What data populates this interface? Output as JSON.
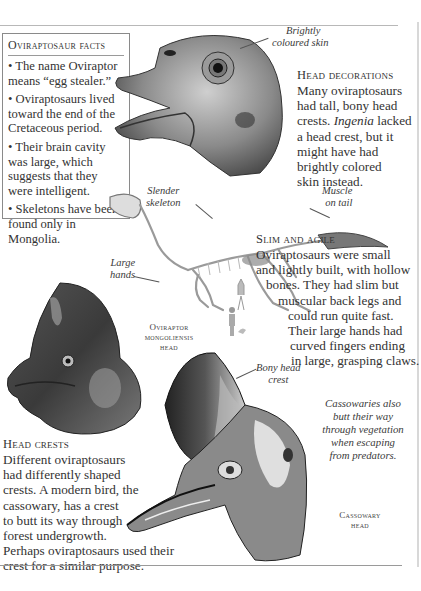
{
  "facts_box": {
    "title": "Oviraptosaur facts",
    "items": [
      "• The name Oviraptor means “egg stealer.”",
      "• Oviraptosaurs lived toward the end of the Cretaceous period.",
      "• Their brain cavity was large, which suggests that they were intelligent.",
      "• Skeletons have been found only in Mongolia."
    ]
  },
  "labels": {
    "brightly_coloured_skin": [
      "Brightly",
      "coloured skin"
    ],
    "slender_skeleton": [
      "Slender",
      "skeleton"
    ],
    "muscle_on_tail": [
      "Muscle",
      "on tail"
    ],
    "large_hands": [
      "Large",
      "hands"
    ],
    "bony_head_crest": [
      "Bony head",
      "crest"
    ]
  },
  "head_decorations": {
    "heading": "Head decorations",
    "lines": [
      "Many oviraptosaurs",
      "had tall, bony head",
      "crests. ",
      "a head crest, but it",
      "might have had",
      "brightly colored",
      "skin instead."
    ],
    "italic_word": "Ingenia",
    "after_italic": " lacked"
  },
  "slim_and_agile": {
    "heading": "Slim and agile",
    "lines": [
      "Oviraptosaurs were small",
      "and lightly built, with hollow",
      "bones. They had slim but",
      "muscular back legs and",
      "could run quite fast.",
      "Their large hands had",
      "curved fingers ending",
      "in large, grasping claws."
    ]
  },
  "captions": {
    "oviraptor_head": [
      "Oviraptor",
      "mongoliensis",
      "head"
    ],
    "cassowary_head": [
      "Cassowary",
      "head"
    ]
  },
  "cassowary_note": [
    "Cassowaries also",
    "butt their way",
    "through vegetation",
    "when escaping",
    "from predators."
  ],
  "head_crests": {
    "heading": "Head crests",
    "lines": [
      "Different oviraptosaurs",
      "had differently shaped",
      "crests. A modern bird, the",
      "cassowary, has a crest",
      "to butt its way through",
      "forest undergrowth.",
      "Perhaps oviraptosaurs used their",
      "crest for a similar purpose."
    ]
  },
  "colors": {
    "text": "#333333",
    "rule": "#9a9a9a",
    "background": "#ffffff"
  }
}
